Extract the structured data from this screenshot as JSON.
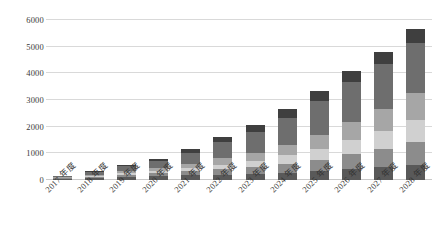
{
  "chart_data": {
    "type": "bar",
    "stacked": true,
    "title": "",
    "xlabel": "",
    "ylabel": "",
    "ylim": [
      0,
      6000
    ],
    "yticks": [
      0,
      1000,
      2000,
      3000,
      4000,
      5000,
      6000
    ],
    "ytick_labels": [
      "0",
      "1000",
      "2000",
      "3000",
      "4000",
      "5000",
      "6000"
    ],
    "grid": true,
    "legend": "none",
    "categories": [
      "2017 年度",
      "2018 年度",
      "2019 年度",
      "2020 年度",
      "2021 年度",
      "2022 年度",
      "2023 年度",
      "2024 年度",
      "2025 年度",
      "2026 年度",
      "2027 年度",
      "2028 年度"
    ],
    "series": [
      {
        "name": "series-1",
        "color": "#595959",
        "values": [
          40,
          70,
          110,
          150,
          170,
          200,
          230,
          270,
          330,
          400,
          470,
          560
        ]
      },
      {
        "name": "series-2",
        "color": "#8c8c8c",
        "values": [
          20,
          45,
          80,
          110,
          150,
          200,
          250,
          330,
          430,
          560,
          700,
          860
        ]
      },
      {
        "name": "series-3",
        "color": "#d0d0d0",
        "values": [
          15,
          35,
          60,
          90,
          130,
          180,
          240,
          320,
          420,
          540,
          680,
          840
        ]
      },
      {
        "name": "series-4",
        "color": "#a6a6a6",
        "values": [
          20,
          45,
          75,
          110,
          160,
          230,
          300,
          400,
          520,
          660,
          820,
          1000
        ]
      },
      {
        "name": "series-5",
        "color": "#6e6e6e",
        "values": [
          40,
          100,
          190,
          270,
          400,
          600,
          780,
          1020,
          1280,
          1530,
          1680,
          1890
        ]
      },
      {
        "name": "series-6",
        "color": "#3f3f3f",
        "values": [
          15,
          35,
          65,
          70,
          140,
          190,
          250,
          310,
          370,
          410,
          450,
          500
        ]
      }
    ],
    "totals": [
      150,
      330,
      580,
      800,
      1150,
      1600,
      2050,
      2650,
      3350,
      4100,
      4800,
      5650
    ]
  }
}
